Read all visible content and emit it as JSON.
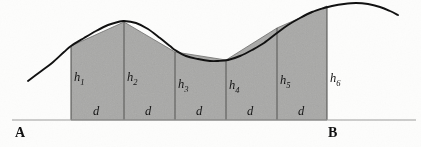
{
  "figure": {
    "kind": "trapezoidal-rule-diagram",
    "caption_labels": {
      "left_endpoint": "A",
      "right_endpoint": "B"
    },
    "ordinate_labels": [
      {
        "name": "h1",
        "base": "h",
        "sub": "1"
      },
      {
        "name": "h2",
        "base": "h",
        "sub": "2"
      },
      {
        "name": "h3",
        "base": "h",
        "sub": "3"
      },
      {
        "name": "h4",
        "base": "h",
        "sub": "4"
      },
      {
        "name": "h5",
        "base": "h",
        "sub": "5"
      },
      {
        "name": "h6",
        "base": "h",
        "sub": "6"
      }
    ],
    "strip_width_labels": [
      "d",
      "d",
      "d",
      "d",
      "d"
    ],
    "colors": {
      "fill": "#a9a9a7",
      "fill_edge": "#6d6d6b",
      "curve": "#111111",
      "baseline": "#9a9a98",
      "background": "#fdfdfc",
      "text": "#141414"
    }
  },
  "chart_data": {
    "type": "area",
    "title": "",
    "xlabel": "",
    "ylabel": "",
    "grid": false,
    "legend": null,
    "axis_baseline_y": 120,
    "xlim": [
      0,
      421
    ],
    "ylim": [
      147,
      0
    ],
    "ordinates": {
      "count": 6,
      "x": [
        71,
        124,
        175,
        226,
        277,
        327
      ],
      "y_top": [
        46,
        22,
        52,
        60,
        28,
        6
      ],
      "heights_px": [
        74,
        98,
        68,
        60,
        92,
        114
      ],
      "strip_width_px": 51,
      "labels": [
        "h1",
        "h2",
        "h3",
        "h4",
        "h5",
        "h6"
      ]
    },
    "strips": {
      "count": 5,
      "label": "d",
      "label_x": [
        97,
        149,
        200,
        251,
        302
      ],
      "label_y": 112
    },
    "curve_points": [
      [
        28,
        81
      ],
      [
        40,
        72
      ],
      [
        52,
        63
      ],
      [
        64,
        52
      ],
      [
        71,
        46
      ],
      [
        84,
        38
      ],
      [
        96,
        31
      ],
      [
        108,
        25
      ],
      [
        118,
        22
      ],
      [
        124,
        21
      ],
      [
        136,
        23
      ],
      [
        148,
        29
      ],
      [
        160,
        38
      ],
      [
        170,
        46
      ],
      [
        175,
        50
      ],
      [
        186,
        56
      ],
      [
        198,
        59
      ],
      [
        210,
        61
      ],
      [
        218,
        61
      ],
      [
        228,
        60
      ],
      [
        240,
        56
      ],
      [
        252,
        50
      ],
      [
        264,
        43
      ],
      [
        277,
        33
      ],
      [
        288,
        25
      ],
      [
        300,
        18
      ],
      [
        312,
        12
      ],
      [
        324,
        8
      ],
      [
        332,
        6
      ],
      [
        344,
        4
      ],
      [
        356,
        3
      ],
      [
        368,
        4
      ],
      [
        380,
        7
      ],
      [
        390,
        11
      ],
      [
        398,
        15
      ]
    ],
    "baseline_extent_x": [
      12,
      416
    ],
    "endpoints": {
      "A": {
        "label": "A",
        "x": 20,
        "y": 131
      },
      "B": {
        "label": "B",
        "x": 332,
        "y": 131
      }
    }
  }
}
